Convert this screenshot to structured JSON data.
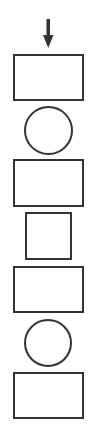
{
  "diagram": {
    "type": "vertical-shape-sequence",
    "direction": "top-to-bottom",
    "stroke_color": "#333333",
    "background_color": "#ffffff",
    "arrow": {
      "icon": "arrow-down-icon",
      "x": 48,
      "y_start": 19,
      "y_end": 48,
      "color": "#333333"
    },
    "shapes": [
      {
        "kind": "rectangle",
        "x": 13,
        "y": 54,
        "w": 71,
        "h": 47
      },
      {
        "kind": "circle",
        "x": 24,
        "y": 106,
        "w": 49,
        "h": 49
      },
      {
        "kind": "rectangle",
        "x": 13,
        "y": 159,
        "w": 71,
        "h": 48
      },
      {
        "kind": "square",
        "x": 25,
        "y": 212,
        "w": 47,
        "h": 48
      },
      {
        "kind": "rectangle",
        "x": 13,
        "y": 266,
        "w": 71,
        "h": 47
      },
      {
        "kind": "circle",
        "x": 24,
        "y": 319,
        "w": 48,
        "h": 48
      },
      {
        "kind": "rectangle",
        "x": 13,
        "y": 372,
        "w": 71,
        "h": 47
      }
    ]
  }
}
